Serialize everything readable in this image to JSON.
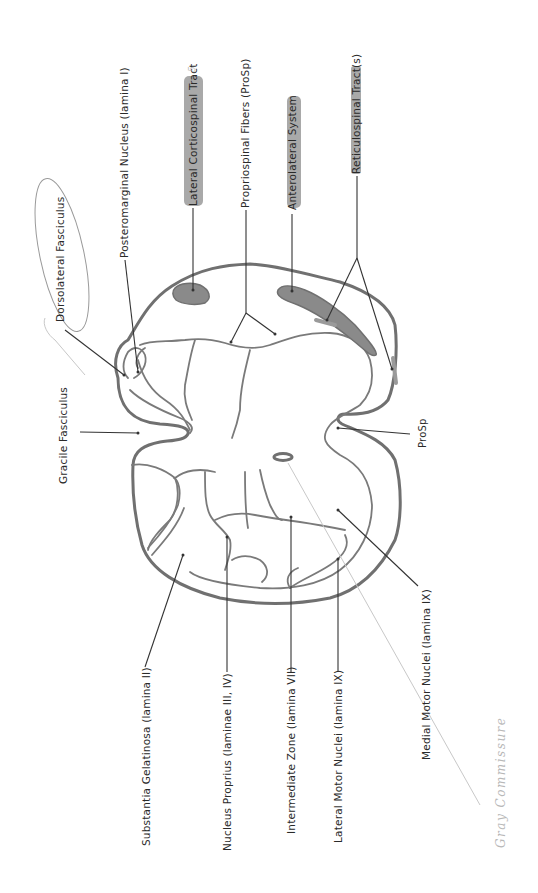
{
  "diagram": {
    "colors": {
      "outline": "#707070",
      "leader": "#333333",
      "highlight": "#9a9a9a",
      "pencil": "#c8c8c8",
      "text": "#2a2a2a"
    },
    "labels_top": [
      {
        "id": "dorsolateral-fasciculus",
        "text": "Dorsolateral Fasciculus",
        "circled": true
      },
      {
        "id": "posteromarginal-nucleus",
        "text": "Posteromarginal Nucleus (lamina I)"
      },
      {
        "id": "lateral-corticospinal-tract",
        "text": "Lateral Corticospinal Tract",
        "highlighted": true
      },
      {
        "id": "propriospinal-fibers",
        "text": "Propriospinal Fibers (ProSp)"
      },
      {
        "id": "anterolateral-system",
        "text": "Anterolateral System",
        "highlighted": true
      },
      {
        "id": "reticulospinal-tracts",
        "text": "Reticulospinal Tract(s)",
        "highlighted": true
      }
    ],
    "labels_left": [
      {
        "id": "gracile-fasciculus",
        "text": "Gracile Fasciculus"
      }
    ],
    "labels_right": [
      {
        "id": "prosp",
        "text": "ProSp"
      }
    ],
    "labels_bottom": [
      {
        "id": "substantia-gelatinosa",
        "text": "Substantia Gelatinosa (lamina II)"
      },
      {
        "id": "nucleus-proprius",
        "text": "Nucleus Proprius (laminae III, IV)"
      },
      {
        "id": "intermediate-zone",
        "text": "Intermediate Zone (lamina VII)"
      },
      {
        "id": "lateral-motor-nuclei",
        "text": "Lateral Motor Nuclei (lamina IX)"
      },
      {
        "id": "medial-motor-nuclei",
        "text": "Medial Motor Nuclei (lamina IX)"
      }
    ],
    "handwritten": [
      {
        "id": "gray-commissure",
        "text": "Gray Commissure"
      },
      {
        "id": "margin-mark",
        "text": "5"
      }
    ]
  }
}
